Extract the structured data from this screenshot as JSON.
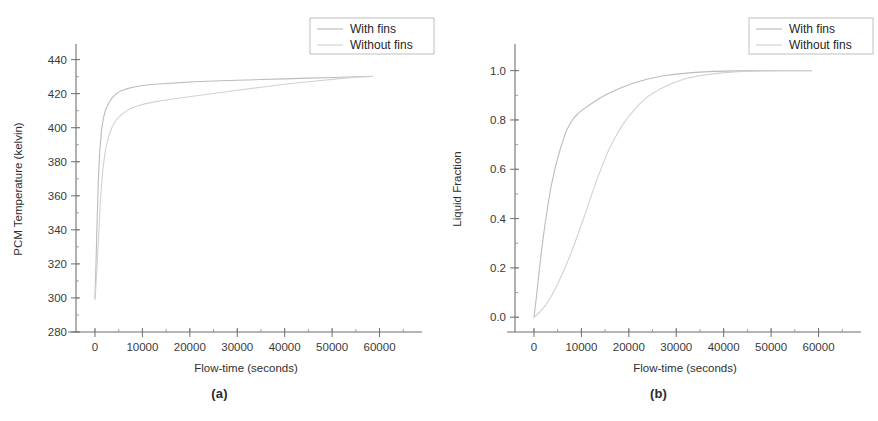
{
  "figure": {
    "background_color": "#ffffff",
    "panels": [
      {
        "caption": "(a)",
        "legend": {
          "position": "top-right",
          "entries": [
            {
              "label": "With fins",
              "color": "#b9b9b9",
              "style": "solid"
            },
            {
              "label": "Without fins",
              "color": "#cfcfcf",
              "style": "solid"
            }
          ]
        },
        "chart_data": {
          "type": "line",
          "title": "",
          "xlabel": "Flow-time (seconds)",
          "ylabel": "PCM Temperature (kelvin)",
          "xlim": [
            -4000,
            66000
          ],
          "ylim": [
            280,
            448
          ],
          "xticks": [
            0,
            10000,
            20000,
            30000,
            40000,
            50000,
            60000
          ],
          "xtick_labels": [
            "0",
            "10000",
            "20000",
            "30000",
            "40000",
            "50000",
            "60000"
          ],
          "yticks": [
            280,
            300,
            320,
            340,
            360,
            380,
            400,
            420,
            440
          ],
          "ytick_labels": [
            "280",
            "300",
            "320",
            "340",
            "360",
            "380",
            "400",
            "420",
            "440"
          ],
          "y_minor_step": 10,
          "x_minor_step": 5000,
          "grid": false,
          "series": [
            {
              "name": "With fins",
              "color": "#bcbcbc",
              "x": [
                0,
                200,
                400,
                700,
                1000,
                1400,
                1800,
                2300,
                2900,
                3600,
                4400,
                5400,
                6600,
                8000,
                10000,
                12500,
                15000,
                18000,
                21000,
                25000,
                30000,
                35000,
                40000,
                45000,
                50000,
                55000,
                58500
              ],
              "y": [
                300,
                318,
                340,
                368,
                386,
                399,
                406,
                411,
                414.5,
                417.5,
                419.8,
                421.5,
                422.8,
                423.8,
                424.8,
                425.5,
                426.0,
                426.5,
                427.0,
                427.4,
                427.9,
                428.3,
                428.7,
                429.1,
                429.5,
                429.9,
                430.2
              ]
            },
            {
              "name": "Without fins",
              "color": "#d2d2d2",
              "x": [
                0,
                300,
                700,
                1100,
                1600,
                2200,
                2900,
                3700,
                4600,
                5700,
                7000,
                8600,
                10500,
                12500,
                15000,
                18000,
                21000,
                25000,
                30000,
                35000,
                40000,
                45000,
                50000,
                55000,
                58500
              ],
              "y": [
                299,
                311,
                332,
                355,
                374,
                387,
                395,
                401,
                405,
                408,
                410.5,
                412.5,
                414,
                415.2,
                416.3,
                417.5,
                418.6,
                420.1,
                422.0,
                423.8,
                425.5,
                427.0,
                428.4,
                429.6,
                430.1
              ]
            }
          ]
        }
      },
      {
        "caption": "(b)",
        "legend": {
          "position": "top-right",
          "entries": [
            {
              "label": "With fins",
              "color": "#b9b9b9",
              "style": "solid"
            },
            {
              "label": "Without fins",
              "color": "#cfcfcf",
              "style": "solid"
            }
          ]
        },
        "chart_data": {
          "type": "line",
          "title": "",
          "xlabel": "Flow-time (seconds)",
          "ylabel": "Liquid Fraction",
          "xlim": [
            -4000,
            66000
          ],
          "ylim": [
            -0.06,
            1.1
          ],
          "xticks": [
            0,
            10000,
            20000,
            30000,
            40000,
            50000,
            60000
          ],
          "xtick_labels": [
            "0",
            "10000",
            "20000",
            "30000",
            "40000",
            "50000",
            "60000"
          ],
          "yticks": [
            0.0,
            0.2,
            0.4,
            0.6,
            0.8,
            1.0
          ],
          "ytick_labels": [
            "0.0",
            "0.2",
            "0.4",
            "0.6",
            "0.8",
            "1.0"
          ],
          "y_minor_step": 0.1,
          "x_minor_step": 5000,
          "grid": false,
          "series": [
            {
              "name": "With fins",
              "color": "#bcbcbc",
              "x": [
                0,
                500,
                1000,
                1600,
                2200,
                2900,
                3600,
                4400,
                5200,
                6000,
                6800,
                7600,
                8500,
                9500,
                10500,
                12000,
                14000,
                16000,
                18000,
                21000,
                24000,
                27000,
                30000,
                34000,
                38000,
                43000,
                48000,
                53000,
                58500
              ],
              "y": [
                0.0,
                0.08,
                0.17,
                0.27,
                0.36,
                0.45,
                0.53,
                0.6,
                0.66,
                0.71,
                0.755,
                0.785,
                0.81,
                0.83,
                0.845,
                0.865,
                0.89,
                0.91,
                0.928,
                0.95,
                0.966,
                0.978,
                0.986,
                0.993,
                0.997,
                0.999,
                1.0,
                1.0,
                1.0
              ]
            },
            {
              "name": "Without fins",
              "color": "#d2d2d2",
              "x": [
                0,
                1200,
                2500,
                3800,
                5000,
                6200,
                7400,
                8600,
                9800,
                11000,
                12200,
                13400,
                14600,
                15800,
                17000,
                18500,
                20000,
                22000,
                24000,
                26500,
                29000,
                32000,
                35000,
                39000,
                43000,
                48000,
                53000,
                58500
              ],
              "y": [
                0.0,
                0.02,
                0.05,
                0.09,
                0.135,
                0.185,
                0.24,
                0.3,
                0.365,
                0.43,
                0.5,
                0.565,
                0.625,
                0.68,
                0.725,
                0.775,
                0.815,
                0.86,
                0.895,
                0.925,
                0.948,
                0.968,
                0.98,
                0.99,
                0.996,
                0.999,
                1.0,
                1.0
              ]
            }
          ]
        }
      }
    ]
  }
}
